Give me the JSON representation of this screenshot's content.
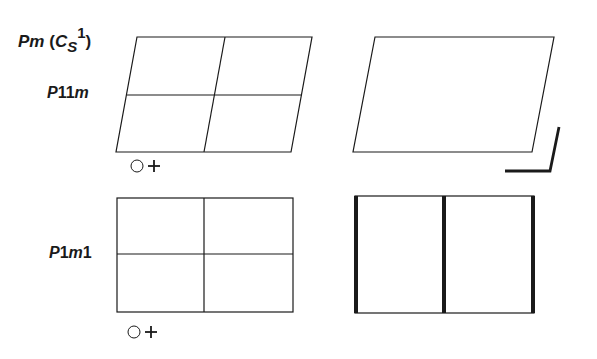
{
  "title": {
    "group_symbol": "Pm",
    "schoenflies_base": "C",
    "schoenflies_sub": "S",
    "schoenflies_sup": "1"
  },
  "rows": [
    {
      "label_prefix": "P",
      "label_mid": "11",
      "label_suffix": "m",
      "full_label": "P11m",
      "cell": "oblique",
      "origin_marker": "circle-plus"
    },
    {
      "label_prefix": "P",
      "label_mid": "1",
      "label_italic": "m",
      "label_suffix": "1",
      "full_label": "P1m1",
      "cell": "rectangular",
      "origin_marker": "circle-plus"
    }
  ],
  "colors": {
    "line": "#1a1a1a",
    "background": "#ffffff"
  }
}
